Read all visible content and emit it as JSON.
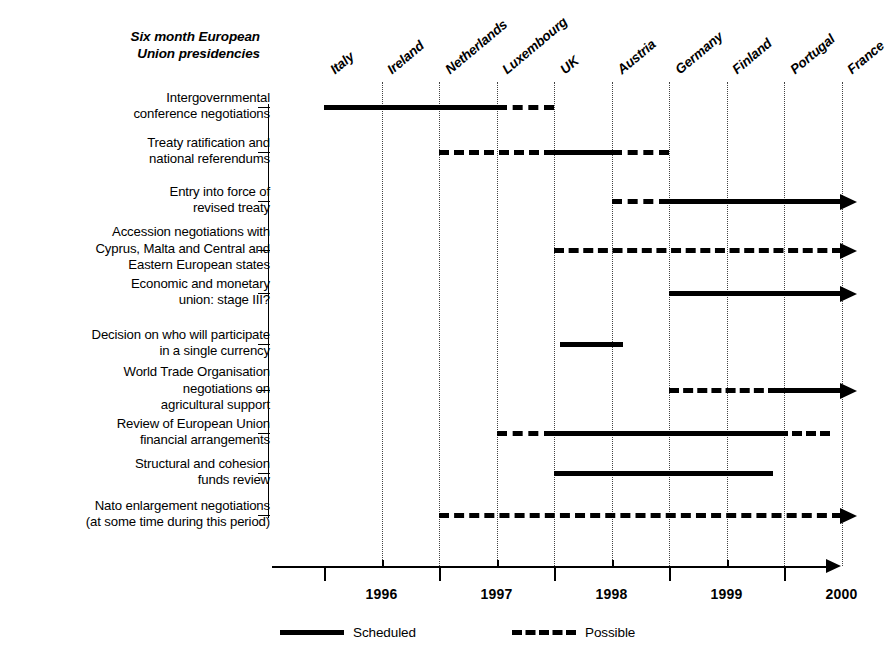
{
  "chart_data": {
    "type": "bar",
    "title": "Six month European Union presidencies",
    "xlabel": "",
    "ylabel": "",
    "xlim": [
      1995.5,
      2000.5
    ],
    "grid": true,
    "legend_position": "bottom",
    "axis": {
      "year_labels": [
        "1996",
        "1997",
        "1998",
        "1999",
        "2000"
      ],
      "year_ticks": [
        1996,
        1997,
        1998,
        1999,
        2000
      ],
      "half_year_ticks": [
        1996.5,
        1997.5,
        1998.5,
        1999.5
      ]
    },
    "presidencies": [
      {
        "country": "Italy",
        "period": "1996 H1"
      },
      {
        "country": "Ireland",
        "period": "1996 H2"
      },
      {
        "country": "Netherlands",
        "period": "1997 H1"
      },
      {
        "country": "Luxembourg",
        "period": "1997 H2"
      },
      {
        "country": "UK",
        "period": "1998 H1"
      },
      {
        "country": "Austria",
        "period": "1998 H2"
      },
      {
        "country": "Germany",
        "period": "1999 H1"
      },
      {
        "country": "Finland",
        "period": "1999 H2"
      },
      {
        "country": "Portugal",
        "period": "2000 H1"
      },
      {
        "country": "France",
        "period": "2000 H2"
      }
    ],
    "legend": [
      {
        "key": "scheduled",
        "label": "Scheduled",
        "style": "solid"
      },
      {
        "key": "possible",
        "label": "Possible",
        "style": "dashed"
      }
    ],
    "categories": [
      "Intergovernmental conference negotiations",
      "Treaty ratification and national referendums",
      "Entry into force of revised treaty",
      "Accession negotiations with Cyprus, Malta and Central and Eastern European states",
      "Economic and monetary union: stage III?",
      "Decision on who will participate in a single currency",
      "World Trade Organisation negotiations on agricultural support",
      "Review of European Union financial arrangements",
      "Structural and cohesion funds review",
      "Nato enlargement negotiations (at some time during this period)"
    ],
    "rows": [
      {
        "id": "igc-negotiations",
        "label_lines": [
          "Intergovernmental",
          "conference negotiations"
        ],
        "segments": [
          {
            "style": "solid",
            "start": 1996.0,
            "end": 1997.5
          },
          {
            "style": "dashed",
            "start": 1997.5,
            "end": 1998.0
          }
        ],
        "open_ended": false
      },
      {
        "id": "treaty-ratification",
        "label_lines": [
          "Treaty ratification and",
          "national referendums"
        ],
        "segments": [
          {
            "style": "dashed",
            "start": 1997.0,
            "end": 1998.0
          },
          {
            "style": "solid",
            "start": 1998.0,
            "end": 1998.5
          },
          {
            "style": "dashed",
            "start": 1998.5,
            "end": 1999.0
          }
        ],
        "open_ended": false
      },
      {
        "id": "entry-into-force",
        "label_lines": [
          "Entry into force of",
          "revised treaty"
        ],
        "segments": [
          {
            "style": "dashed",
            "start": 1998.5,
            "end": 1999.0
          },
          {
            "style": "solid",
            "start": 1999.0,
            "end": 2000.5
          }
        ],
        "open_ended": true
      },
      {
        "id": "accession-negotiations",
        "label_lines": [
          "Accession negotiations with",
          "Cyprus, Malta and Central and",
          "Eastern European states"
        ],
        "segments": [
          {
            "style": "dashed",
            "start": 1998.0,
            "end": 2000.5
          }
        ],
        "open_ended": true
      },
      {
        "id": "emu-stage-three",
        "label_lines": [
          "Economic and monetary",
          "union: stage III?"
        ],
        "segments": [
          {
            "style": "solid",
            "start": 1999.0,
            "end": 2000.5
          }
        ],
        "open_ended": true
      },
      {
        "id": "single-currency-decision",
        "label_lines": [
          "Decision on who will participate",
          "in a single currency"
        ],
        "segments": [
          {
            "style": "solid",
            "start": 1998.05,
            "end": 1998.6
          }
        ],
        "open_ended": false
      },
      {
        "id": "wto-agricultural-support",
        "label_lines": [
          "World Trade Organisation",
          "negotiations on",
          "agricultural support"
        ],
        "segments": [
          {
            "style": "dashed",
            "start": 1999.0,
            "end": 1999.95
          },
          {
            "style": "solid",
            "start": 1999.95,
            "end": 2000.5
          }
        ],
        "open_ended": true
      },
      {
        "id": "eu-financial-arrangements-review",
        "label_lines": [
          "Review of European Union",
          "financial arrangements"
        ],
        "segments": [
          {
            "style": "dashed",
            "start": 1997.5,
            "end": 1998.0
          },
          {
            "style": "solid",
            "start": 1998.0,
            "end": 1999.95
          },
          {
            "style": "dashed",
            "start": 1999.95,
            "end": 2000.4
          }
        ],
        "open_ended": false
      },
      {
        "id": "structural-cohesion-funds-review",
        "label_lines": [
          "Structural and cohesion",
          "funds review"
        ],
        "segments": [
          {
            "style": "solid",
            "start": 1998.0,
            "end": 1999.9
          }
        ],
        "open_ended": false
      },
      {
        "id": "nato-enlargement",
        "label_lines": [
          "Nato enlargement negotiations",
          "(at some time during this period)"
        ],
        "segments": [
          {
            "style": "dashed",
            "start": 1997.0,
            "end": 2000.5
          }
        ],
        "open_ended": true
      }
    ]
  }
}
